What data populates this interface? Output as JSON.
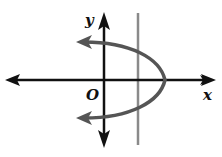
{
  "diagram": {
    "type": "coordinate-graph",
    "labels": {
      "x_axis": "x",
      "y_axis": "y",
      "origin": "O"
    },
    "colors": {
      "axes": "#111111",
      "parabola": "#555555",
      "vertical_line": "#8a8a8a",
      "background": "#ffffff"
    },
    "geometry": {
      "origin_px": [
        104,
        80
      ],
      "x_axis_px": {
        "from": [
          5,
          80
        ],
        "to": [
          216,
          80
        ]
      },
      "y_axis_px": {
        "from": [
          104,
          147
        ],
        "to": [
          104,
          13
        ]
      },
      "parabola_vertex_px": [
        165,
        80
      ],
      "parabola_upper_end_px": [
        77,
        42
      ],
      "parabola_lower_end_px": [
        77,
        118
      ],
      "vertical_line_x_px": 138,
      "vertical_line_y_range_px": [
        13,
        145
      ]
    }
  }
}
